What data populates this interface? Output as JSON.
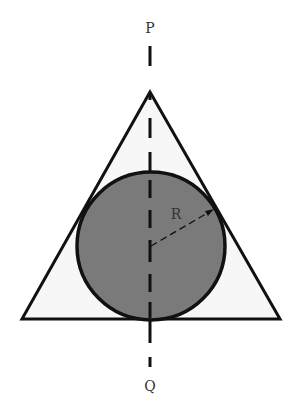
{
  "diagram": {
    "type": "geometry",
    "labels": {
      "top_axis": "P",
      "bottom_axis": "Q",
      "radius": "R"
    },
    "colors": {
      "background": "#ffffff",
      "triangle_fill": "#f7f7f7",
      "circle_fill": "#7a7a7a",
      "stroke": "#111111",
      "label": "#333333"
    },
    "triangle": {
      "apex": [
        150,
        92
      ],
      "base_left": [
        22,
        319
      ],
      "base_right": [
        280,
        319
      ]
    },
    "circle": {
      "center": [
        151,
        246
      ],
      "radius": 74
    },
    "radius_line": {
      "from": [
        151,
        246
      ],
      "to": [
        213,
        210
      ]
    },
    "axis": {
      "x": 150,
      "top": 45,
      "bottom": 370
    }
  }
}
